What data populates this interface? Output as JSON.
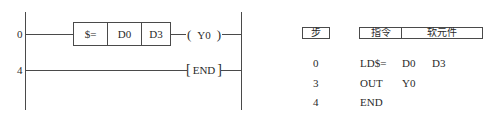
{
  "ladder": {
    "rungs": [
      {
        "step": "0",
        "compare_block": {
          "op": "$=",
          "src1": "D0",
          "src2": "D3"
        },
        "output_coil": "Y0"
      },
      {
        "step": "4",
        "instruction": "END"
      }
    ],
    "line_color": "#4a4a4a"
  },
  "instruction_table": {
    "headers": {
      "step": "步",
      "instruction": "指令",
      "device": "软元件"
    },
    "rows": [
      {
        "step": "0",
        "instruction": "LD$=",
        "operand1": "D0",
        "operand2": "D3"
      },
      {
        "step": "3",
        "instruction": "OUT",
        "operand1": "Y0",
        "operand2": ""
      },
      {
        "step": "4",
        "instruction": "END",
        "operand1": "",
        "operand2": ""
      }
    ]
  }
}
